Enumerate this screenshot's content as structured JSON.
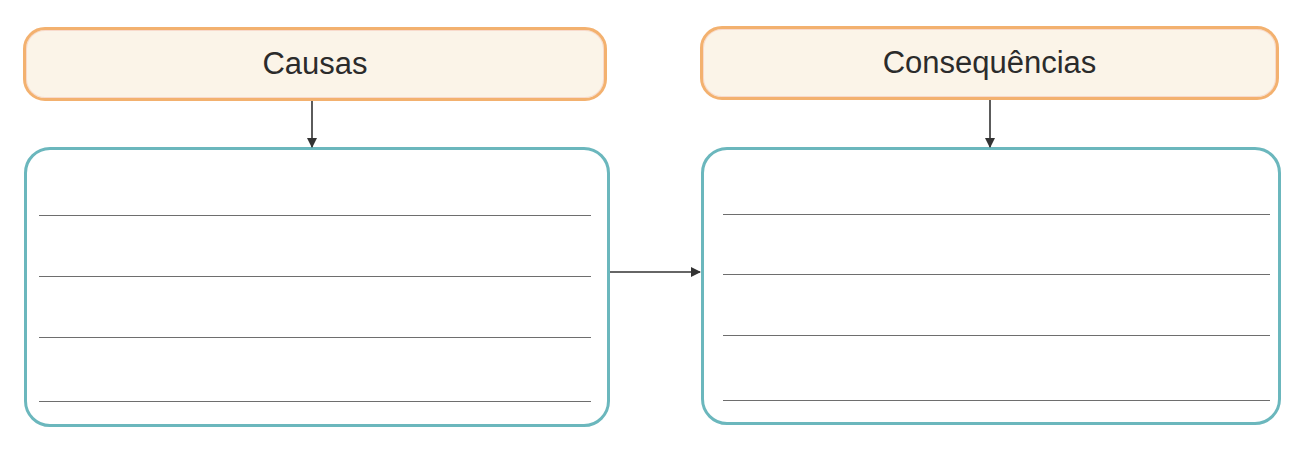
{
  "diagram": {
    "type": "cause-consequence organizer",
    "colors": {
      "header_fill": "#fbf4e8",
      "header_border": "#f3b16f",
      "box_border": "#6bb7bd",
      "line_color": "#6e6e6e",
      "arrow_color": "#333333",
      "text_color": "#2b2b2b"
    },
    "columns": [
      {
        "id": "causes",
        "header": "Causas",
        "answer_lines": 4
      },
      {
        "id": "consequences",
        "header": "Consequências",
        "answer_lines": 4
      }
    ],
    "connectors": [
      {
        "from": "Causas header",
        "to": "Causas box",
        "direction": "down"
      },
      {
        "from": "Consequências header",
        "to": "Consequências box",
        "direction": "down"
      },
      {
        "from": "Causas box",
        "to": "Consequências box",
        "direction": "right"
      }
    ]
  }
}
